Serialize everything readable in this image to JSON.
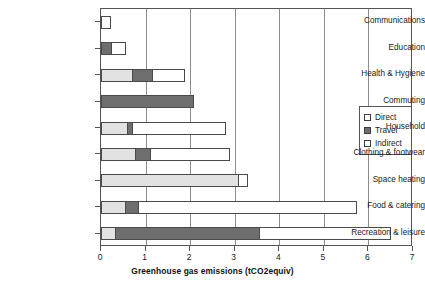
{
  "chart_data": {
    "type": "bar",
    "orientation": "horizontal",
    "stacked": true,
    "title": "",
    "xlabel": "Greenhouse gas emissions (tCO2equiv)",
    "ylabel": "",
    "xlim": [
      0,
      7
    ],
    "xticks": [
      "0",
      "1",
      "2",
      "3",
      "4",
      "5",
      "6",
      "7"
    ],
    "grid": "vertical",
    "legend_position": "right",
    "categories": [
      "Communications",
      "Education",
      "Health & Hygiene",
      "Commuting",
      "Household",
      "Clothing & footwear",
      "Space heating",
      "Food & catering",
      "Recreation & leisure"
    ],
    "series": [
      {
        "name": "Direct",
        "color": "#e2e2e2",
        "values": [
          0.0,
          0.0,
          0.72,
          0.0,
          0.6,
          0.78,
          3.1,
          0.55,
          0.33
        ]
      },
      {
        "name": "Travel",
        "color": "#6e6e6e",
        "values": [
          0.0,
          0.25,
          0.45,
          2.08,
          0.12,
          0.35,
          0.0,
          0.3,
          3.24
        ]
      },
      {
        "name": "Indirect",
        "color": "#ffffff",
        "values": [
          0.23,
          0.32,
          0.71,
          0.0,
          2.08,
          1.77,
          0.2,
          4.9,
          2.93
        ]
      }
    ],
    "totals": [
      0.23,
      0.57,
      1.88,
      2.08,
      2.8,
      2.9,
      3.3,
      5.75,
      6.5
    ]
  },
  "legend": {
    "items": [
      {
        "label": "Direct",
        "swatch": "sw-direct"
      },
      {
        "label": "Travel",
        "swatch": "sw-travel"
      },
      {
        "label": "Indirect",
        "swatch": "sw-indirect"
      }
    ]
  }
}
